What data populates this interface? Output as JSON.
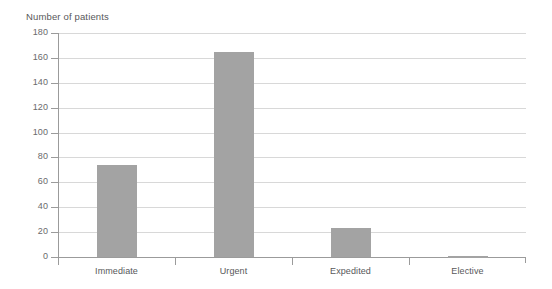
{
  "chart_data": {
    "type": "bar",
    "title": "Number of patients",
    "xlabel": "",
    "ylabel": "Number of patients",
    "categories": [
      "Immediate",
      "Urgent",
      "Expedited",
      "Elective"
    ],
    "values": [
      74,
      165,
      23,
      1
    ],
    "ylim": [
      0,
      180
    ],
    "ytick_step": 20,
    "yticks": [
      0,
      20,
      40,
      60,
      80,
      100,
      120,
      140,
      160,
      180
    ],
    "ytick_labels": [
      "0",
      "20",
      "40",
      "60",
      "80",
      "100",
      "120",
      "140",
      "160",
      "180"
    ],
    "grid": true,
    "grid_axis": "y",
    "legend": false,
    "legend_position": "none",
    "series": [
      {
        "name": "Number of patients",
        "values": [
          74,
          165,
          23,
          1
        ],
        "color": "#a3a3a3"
      }
    ],
    "colors": {
      "bar": "#a3a3a3",
      "gridline": "#d8d8d8",
      "axis": "#9b9b9b",
      "text": "#58585a",
      "background": "#ffffff"
    }
  }
}
